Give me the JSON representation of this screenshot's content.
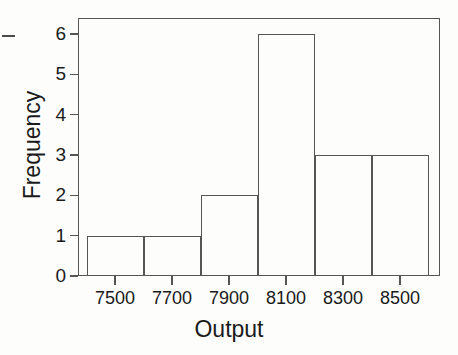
{
  "chart_data": {
    "type": "bar",
    "title": "",
    "subtitle": "",
    "xlabel": "Output",
    "ylabel": "Frequency",
    "categories": [
      "7400-7600",
      "7600-7800",
      "7800-8000",
      "8000-8200",
      "8200-8400",
      "8400-8600"
    ],
    "bin_edges": [
      7400,
      7600,
      7800,
      8000,
      8200,
      8400,
      8600
    ],
    "values": [
      1,
      1,
      2,
      6,
      3,
      3
    ],
    "bin_width": 200,
    "xlim": [
      7370,
      8640
    ],
    "ylim": [
      0,
      6.4
    ],
    "xticks": [
      7500,
      7700,
      7900,
      8100,
      8300,
      8500
    ],
    "xtick_labels": [
      "7500",
      "7700",
      "7900",
      "8100",
      "8300",
      "8500"
    ],
    "yticks": [
      0,
      1,
      2,
      3,
      4,
      5,
      6
    ],
    "ytick_labels": [
      "0",
      "1",
      "2",
      "3",
      "4",
      "5",
      "6"
    ],
    "grid": false,
    "legend": null,
    "legend_position": "none",
    "total_count": 16,
    "bar_fill": "none",
    "line_color": "#555555",
    "background_color": "#fdfdfc",
    "text_color": "#1a1a1a"
  },
  "axes": {
    "x": {
      "label": "Output",
      "ticks": [
        {
          "label": "7500",
          "value": 7500
        },
        {
          "label": "7700",
          "value": 7700
        },
        {
          "label": "7900",
          "value": 7900
        },
        {
          "label": "8100",
          "value": 8100
        },
        {
          "label": "8300",
          "value": 8300
        },
        {
          "label": "8500",
          "value": 8500
        }
      ]
    },
    "y": {
      "label": "Frequency",
      "ticks": [
        {
          "label": "0",
          "value": 0
        },
        {
          "label": "1",
          "value": 1
        },
        {
          "label": "2",
          "value": 2
        },
        {
          "label": "3",
          "value": 3
        },
        {
          "label": "4",
          "value": 4
        },
        {
          "label": "5",
          "value": 5
        },
        {
          "label": "6",
          "value": 6
        }
      ]
    }
  },
  "bars": [
    {
      "label": "7400-7600",
      "value": 1
    },
    {
      "label": "7600-7800",
      "value": 1
    },
    {
      "label": "7800-8000",
      "value": 2
    },
    {
      "label": "8000-8200",
      "value": 6
    },
    {
      "label": "8200-8400",
      "value": 3
    },
    {
      "label": "8400-8600",
      "value": 3
    }
  ]
}
